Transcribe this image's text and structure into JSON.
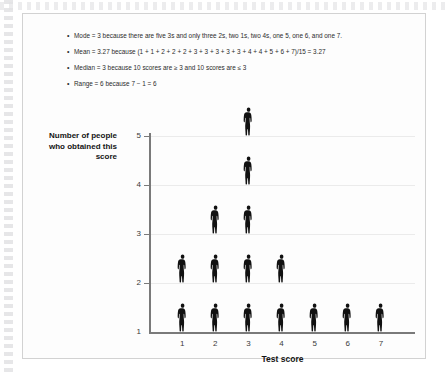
{
  "bullets": [
    {
      "marker": "•",
      "text": "Mode = 3 because there are five 3s and only three 2s, two 1s, two 4s, one 5, one 6, and one 7."
    },
    {
      "marker": "•",
      "text": "Mean = 3.27 because (1 + 1 + 2 + 2 + 2 + 3 + 3 + 3 + 3 + 3 + 4 + 4 + 5 + 6 + 7)/15 = 3.27"
    },
    {
      "marker": "•",
      "text": "Median = 3 because 10 scores are ≥  3 and 10 scores are ≤ 3"
    },
    {
      "marker": "•",
      "text": "Range = 6 because 7 − 1 = 6"
    }
  ],
  "chart_data": {
    "type": "bar",
    "title": "",
    "subtitle": "",
    "xlabel": "Test score",
    "ylabel": "Number of people who obtained this score",
    "categories": [
      "1",
      "2",
      "3",
      "4",
      "5",
      "6",
      "7"
    ],
    "values": [
      2,
      3,
      5,
      2,
      1,
      1,
      1
    ],
    "x_tick_labels": [
      "1",
      "2",
      "3",
      "4",
      "5",
      "6",
      "7"
    ],
    "y_tick_labels": [
      "1",
      "2",
      "3",
      "4",
      "5"
    ],
    "ylim": [
      1,
      5
    ],
    "xlim": [
      0.5,
      7.5
    ],
    "grid": true,
    "legend": "none",
    "marker_glyph": "person-silhouette",
    "marker_color": "#111111",
    "axis_color": "#7a7a7a",
    "gridline_color": "#ebebeb",
    "note": "pictograph: one person silhouette per observation stacked vertically"
  }
}
